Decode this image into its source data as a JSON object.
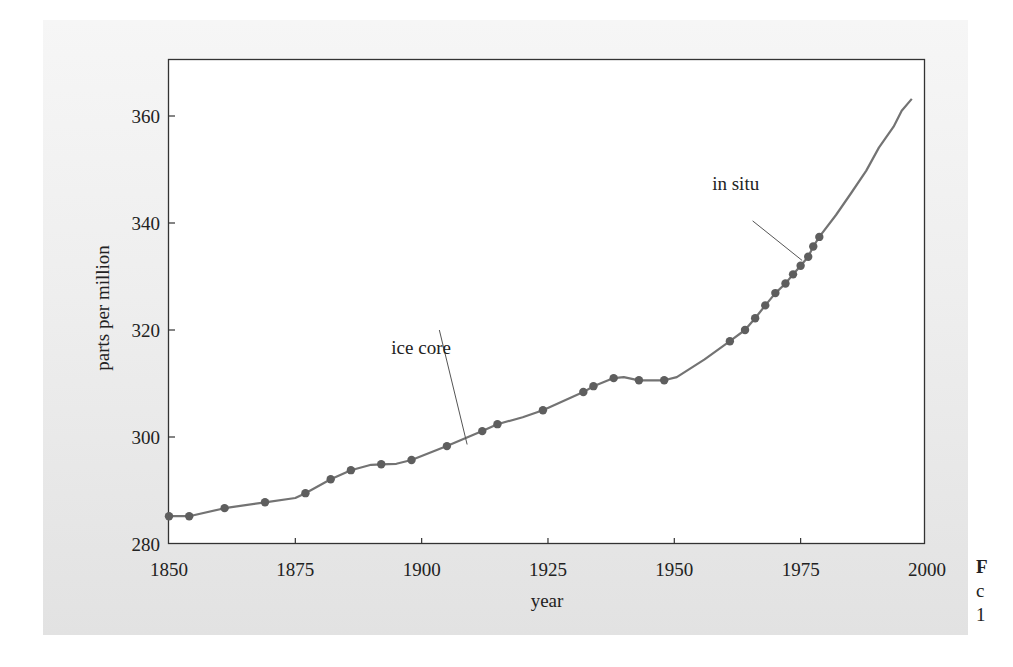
{
  "chart_data": {
    "type": "line",
    "title": "",
    "xlabel": "year",
    "ylabel": "parts per million",
    "xlim": [
      1850,
      2000
    ],
    "ylim": [
      280,
      370
    ],
    "grid": false,
    "legend": null,
    "x_ticks": [
      1850,
      1875,
      1900,
      1925,
      1950,
      1975,
      2000
    ],
    "y_ticks": [
      280,
      300,
      320,
      340,
      360
    ],
    "series": [
      {
        "name": "ice core",
        "style": "line-with-markers",
        "points": [
          [
            1850,
            285.2
          ],
          [
            1854,
            285.2
          ],
          [
            1861,
            286.7
          ],
          [
            1869,
            287.8
          ],
          [
            1877,
            289.5
          ],
          [
            1882,
            292.1
          ],
          [
            1886,
            293.8
          ],
          [
            1892,
            294.9
          ],
          [
            1898,
            295.7
          ],
          [
            1905,
            298.3
          ],
          [
            1912,
            301.1
          ],
          [
            1915,
            302.4
          ],
          [
            1924,
            305.0
          ],
          [
            1932,
            308.4
          ],
          [
            1934,
            309.5
          ],
          [
            1938,
            311.0
          ],
          [
            1943,
            310.6
          ],
          [
            1948,
            310.6
          ],
          [
            1961,
            317.9
          ],
          [
            1964,
            320.0
          ],
          [
            1966,
            322.2
          ],
          [
            1968,
            324.6
          ],
          [
            1970,
            326.9
          ],
          [
            1972,
            328.7
          ],
          [
            1973.5,
            330.4
          ],
          [
            1975,
            332.0
          ],
          [
            1976.5,
            333.7
          ],
          [
            1977.5,
            335.6
          ],
          [
            1978.7,
            337.4
          ]
        ]
      },
      {
        "name": "in situ",
        "style": "line",
        "points": [
          [
            1978.7,
            337.4
          ],
          [
            1982,
            341.5
          ],
          [
            1985,
            345.6
          ],
          [
            1988,
            349.8
          ],
          [
            1990.5,
            354.1
          ],
          [
            1993.4,
            358.0
          ],
          [
            1995,
            361.0
          ],
          [
            1997,
            363.2
          ]
        ]
      }
    ],
    "line_path": [
      [
        1850,
        285.2
      ],
      [
        1854,
        285.2
      ],
      [
        1861,
        286.7
      ],
      [
        1869,
        287.8
      ],
      [
        1875,
        288.6
      ],
      [
        1877,
        289.5
      ],
      [
        1882,
        292.1
      ],
      [
        1886,
        293.8
      ],
      [
        1890,
        294.8
      ],
      [
        1892,
        294.9
      ],
      [
        1895,
        295.0
      ],
      [
        1898,
        295.7
      ],
      [
        1905,
        298.3
      ],
      [
        1912,
        301.1
      ],
      [
        1915,
        302.4
      ],
      [
        1920,
        303.7
      ],
      [
        1924,
        305.0
      ],
      [
        1932,
        308.4
      ],
      [
        1934,
        309.5
      ],
      [
        1938,
        311.0
      ],
      [
        1940,
        311.2
      ],
      [
        1943,
        310.6
      ],
      [
        1948,
        310.6
      ],
      [
        1950.5,
        311.2
      ],
      [
        1956,
        314.5
      ],
      [
        1961,
        317.9
      ],
      [
        1964,
        320.0
      ],
      [
        1966,
        322.2
      ],
      [
        1968,
        324.6
      ],
      [
        1970,
        326.9
      ],
      [
        1972,
        328.7
      ],
      [
        1973.5,
        330.4
      ],
      [
        1975,
        332.0
      ],
      [
        1976.5,
        333.7
      ],
      [
        1977.5,
        335.6
      ],
      [
        1978.7,
        337.4
      ],
      [
        1982,
        341.5
      ],
      [
        1985,
        345.6
      ],
      [
        1988,
        349.8
      ],
      [
        1990.5,
        354.1
      ],
      [
        1993.4,
        358.0
      ],
      [
        1995,
        361.0
      ],
      [
        1997,
        363.2
      ]
    ],
    "annotations": [
      {
        "text": "ice core",
        "label_x": 1894,
        "label_y": 315.5,
        "line_from": [
          1903.5,
          320.0
        ],
        "line_to": [
          1909,
          298.6
        ]
      },
      {
        "text": "in situ",
        "label_x": 1957.5,
        "label_y": 346.2,
        "line_from": [
          1965.5,
          340.4
        ],
        "line_to": [
          1975.3,
          333.0
        ]
      }
    ]
  },
  "caption_fragments": [
    {
      "text": "F",
      "bold": true
    },
    {
      "text": "c",
      "bold": false
    },
    {
      "text": "1",
      "bold": false
    }
  ],
  "colors": {
    "line": "#737373",
    "marker": "#5e5e5e",
    "axis": "#333333",
    "leader": "#555555"
  }
}
